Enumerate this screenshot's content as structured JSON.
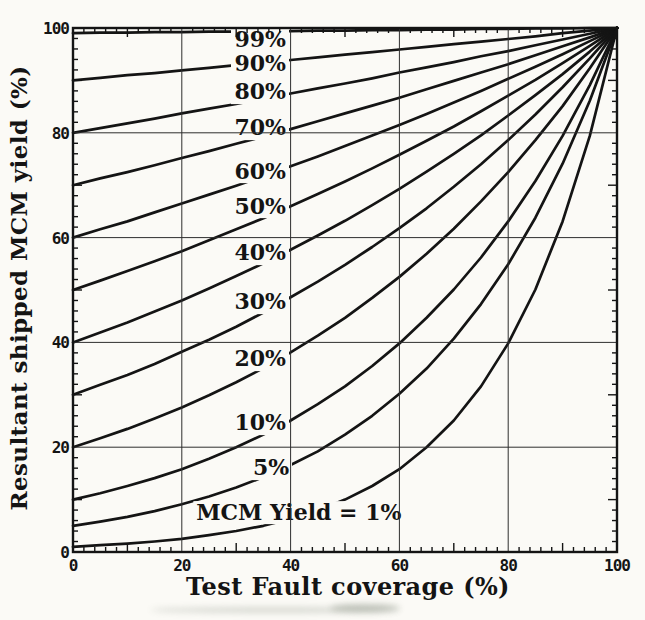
{
  "figure": {
    "paper_color": "#fbfaf6",
    "ink_color": "#141414",
    "grid_color": "#2e2e2e"
  },
  "chart_data": {
    "type": "line",
    "title": "",
    "xlabel": "Test Fault coverage (%)",
    "ylabel": "Resultant shipped MCM yield (%)",
    "xlim": [
      0,
      100
    ],
    "ylim": [
      0,
      100
    ],
    "x_ticks": [
      0,
      20,
      40,
      60,
      80,
      100
    ],
    "y_ticks": [
      0,
      20,
      40,
      60,
      80,
      100
    ],
    "minor_tick_step": 2,
    "grid": true,
    "legend_position": "inline-labels",
    "x": [
      0,
      5,
      10,
      15,
      20,
      25,
      30,
      35,
      40,
      45,
      50,
      55,
      60,
      65,
      70,
      75,
      80,
      85,
      90,
      95,
      100
    ],
    "series": [
      {
        "name": "99%",
        "mcm_yield_pct": 99,
        "values": [
          99,
          99.1,
          99.1,
          99.2,
          99.2,
          99.3,
          99.3,
          99.4,
          99.4,
          99.5,
          99.5,
          99.6,
          99.6,
          99.7,
          99.7,
          99.8,
          99.8,
          99.9,
          99.9,
          100,
          100
        ]
      },
      {
        "name": "90%",
        "mcm_yield_pct": 90,
        "values": [
          90,
          90.5,
          91,
          91.4,
          91.9,
          92.4,
          92.9,
          93.4,
          93.9,
          94.4,
          94.9,
          95.4,
          95.9,
          96.4,
          96.9,
          97.4,
          97.9,
          98.4,
          99,
          99.5,
          100
        ]
      },
      {
        "name": "80%",
        "mcm_yield_pct": 80,
        "values": [
          80,
          80.9,
          81.8,
          82.7,
          83.7,
          84.6,
          85.5,
          86.5,
          87.5,
          88.5,
          89.4,
          90.4,
          91.5,
          92.5,
          93.5,
          94.6,
          95.6,
          96.7,
          97.8,
          98.9,
          100
        ]
      },
      {
        "name": "70%",
        "mcm_yield_pct": 70,
        "values": [
          70,
          71.3,
          72.5,
          73.8,
          75.2,
          76.5,
          77.9,
          79.3,
          80.7,
          82.2,
          83.7,
          85.2,
          86.7,
          88.3,
          89.9,
          91.5,
          93.1,
          94.8,
          96.5,
          98.2,
          100
        ]
      },
      {
        "name": "60%",
        "mcm_yield_pct": 60,
        "values": [
          60,
          61.6,
          63.1,
          64.8,
          66.5,
          68.2,
          69.9,
          71.7,
          73.6,
          75.5,
          77.5,
          79.5,
          81.5,
          83.6,
          85.8,
          88,
          90.3,
          92.6,
          95,
          97.5,
          100
        ]
      },
      {
        "name": "50%",
        "mcm_yield_pct": 50,
        "values": [
          50,
          51.8,
          53.6,
          55.5,
          57.4,
          59.5,
          61.6,
          63.7,
          66,
          68.3,
          70.7,
          73.2,
          75.8,
          78.5,
          81.2,
          84.1,
          87.1,
          90.1,
          93.3,
          96.6,
          100
        ]
      },
      {
        "name": "40%",
        "mcm_yield_pct": 40,
        "values": [
          40,
          41.9,
          43.8,
          45.9,
          48,
          50.3,
          52.7,
          55.1,
          57.7,
          60.4,
          63.2,
          66.2,
          69.3,
          72.6,
          76,
          79.5,
          83.3,
          87.2,
          91.2,
          95.5,
          100
        ]
      },
      {
        "name": "30%",
        "mcm_yield_pct": 30,
        "values": [
          30,
          31.9,
          33.8,
          35.9,
          38.2,
          40.5,
          43,
          45.7,
          48.6,
          51.6,
          54.8,
          58.2,
          61.8,
          65.6,
          69.7,
          74,
          78.6,
          83.5,
          88.7,
          94.2,
          100
        ]
      },
      {
        "name": "20%",
        "mcm_yield_pct": 20,
        "values": [
          20,
          21.7,
          23.5,
          25.5,
          27.6,
          29.9,
          32.4,
          35.1,
          38.1,
          41.3,
          44.7,
          48.5,
          52.5,
          56.9,
          61.7,
          66.9,
          72.5,
          78.6,
          85.1,
          92.3,
          100
        ]
      },
      {
        "name": "10%",
        "mcm_yield_pct": 10,
        "values": [
          10,
          11.2,
          12.6,
          14.1,
          15.8,
          17.8,
          20,
          22.4,
          25.1,
          28.2,
          31.6,
          35.5,
          39.8,
          44.7,
          50.1,
          56.2,
          63.1,
          70.8,
          79.4,
          89.1,
          100
        ]
      },
      {
        "name": "5%",
        "mcm_yield_pct": 5,
        "values": [
          5,
          5.8,
          6.7,
          7.8,
          9.1,
          10.6,
          12.3,
          14.3,
          16.6,
          19.2,
          22.4,
          26,
          30.2,
          35,
          40.7,
          47.3,
          54.9,
          63.8,
          74.1,
          86.1,
          100
        ]
      },
      {
        "name": "1%",
        "mcm_yield_pct": 1,
        "values": [
          1,
          1.3,
          1.6,
          2,
          2.5,
          3.2,
          4,
          5,
          6.3,
          7.9,
          10,
          12.6,
          15.8,
          20,
          25.1,
          31.6,
          39.8,
          50.1,
          63.1,
          79.4,
          100
        ]
      }
    ],
    "curve_labels": [
      {
        "text": "99%",
        "x": 39.7,
        "y": 97.7,
        "anchor": "end"
      },
      {
        "text": "90%",
        "x": 39.7,
        "y": 93.2,
        "anchor": "end"
      },
      {
        "text": "80%",
        "x": 39.7,
        "y": 87.8,
        "anchor": "end"
      },
      {
        "text": "70%",
        "x": 39.7,
        "y": 80.9,
        "anchor": "end"
      },
      {
        "text": "60%",
        "x": 39.7,
        "y": 72.6,
        "anchor": "end"
      },
      {
        "text": "50%",
        "x": 39.7,
        "y": 65.9,
        "anchor": "end"
      },
      {
        "text": "40%",
        "x": 39.7,
        "y": 57.1,
        "anchor": "end"
      },
      {
        "text": "30%",
        "x": 39.7,
        "y": 47.7,
        "anchor": "end"
      },
      {
        "text": "20%",
        "x": 39.7,
        "y": 36.8,
        "anchor": "end"
      },
      {
        "text": "10%",
        "x": 39.7,
        "y": 24.6,
        "anchor": "end"
      },
      {
        "text": "5%",
        "x": 40.3,
        "y": 16.0,
        "anchor": "end"
      },
      {
        "text": "MCM Yield = 1%",
        "x": 41.5,
        "y": 7.5,
        "anchor": "middle"
      }
    ]
  }
}
